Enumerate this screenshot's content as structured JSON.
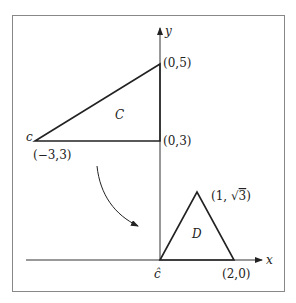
{
  "diagram": {
    "axes": {
      "x_label": "x",
      "y_label": "y"
    },
    "region_c": {
      "name": "C",
      "vertex_label": "c",
      "vertices": [
        {
          "label": "(0,5)"
        },
        {
          "label": "(0,3)"
        },
        {
          "label": "(−3,3)"
        }
      ]
    },
    "region_d": {
      "name": "D",
      "vertex_label": "ĉ",
      "vertices": [
        {
          "label_prefix": "(1, ",
          "label_sqrt": "√",
          "label_rad": "3",
          "label_suffix": ")"
        },
        {
          "label": "(2,0)"
        }
      ]
    },
    "colors": {
      "stroke": "#222222",
      "frame": "#888888"
    }
  }
}
